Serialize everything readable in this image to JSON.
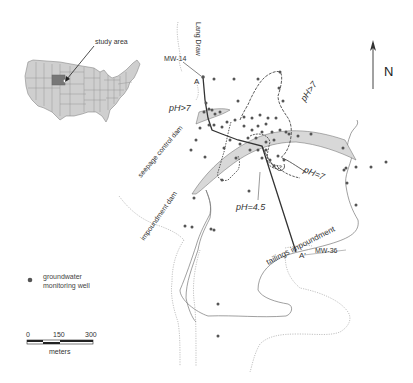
{
  "inset": {
    "label": "study area",
    "description": "Map of contiguous United States with Wyoming highlighted",
    "highlight_color": "#777777",
    "state_fill": "#cfcfcf"
  },
  "north_arrow": {
    "label": "N"
  },
  "labels": {
    "lang_draw": "Lang Draw",
    "mw14": "MW-14",
    "mw36": "MW-36",
    "a": "A",
    "a_prime": "A'",
    "ph_gt7_left": "pH>7",
    "ph_gt7_right": "pH>7",
    "ph_eq7": "pH=7",
    "ph_eq45": "pH=4.5",
    "seepage_dam": "seepage control dam",
    "impoundment_dam": "impoundment dam",
    "tailings": "tailings impoundment"
  },
  "legend": {
    "symbol": "groundwater-monitoring-well-dot",
    "line1": "groundwater",
    "line2": "monitoring well"
  },
  "scale_bar": {
    "ticks": [
      "0",
      "150",
      "300"
    ],
    "unit": "meters"
  },
  "colors": {
    "well": "#555555",
    "dam_fill": "#d8d8d8",
    "line": "#444444",
    "contour": "#333333",
    "boundary": "#888888"
  }
}
